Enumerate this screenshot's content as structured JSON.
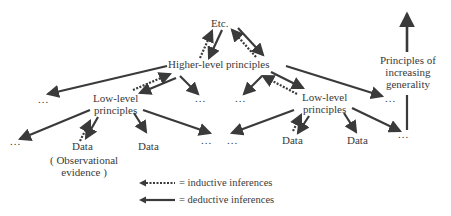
{
  "nodes": {
    "etc": "Etc.",
    "higher": "Higher-level principles",
    "low_left_1": "Low-level",
    "low_left_2": "principles",
    "low_right_1": "Low-level",
    "low_right_2": "principles",
    "data_1": "Data",
    "data_2": "Data",
    "data_3": "Data",
    "data_4": "Data",
    "obs_1": "( Observational",
    "obs_2": "evidence )",
    "ellipsis": "...",
    "generality_1": "Principles of",
    "generality_2": "increasing",
    "generality_3": "generality"
  },
  "legend": {
    "inductive": "= inductive inferences",
    "deductive": "= deductive inferences"
  },
  "colors": {
    "ink": "#3a3a3a"
  }
}
